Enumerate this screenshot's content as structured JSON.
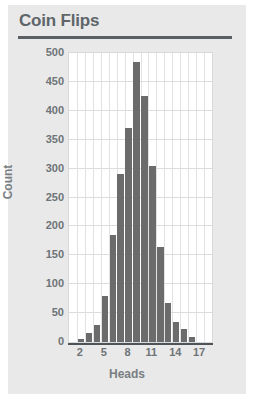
{
  "card": {
    "background_color": "#e9e9e9"
  },
  "header": {
    "title": "Coin Flips",
    "rule_color": "#5a5f63"
  },
  "chart_data": {
    "type": "bar",
    "title": "Coin Flips",
    "xlabel": "Heads",
    "ylabel": "Count",
    "categories": [
      1,
      2,
      3,
      4,
      5,
      6,
      7,
      8,
      9,
      10,
      11,
      12,
      13,
      14,
      15,
      16,
      17,
      18
    ],
    "values": [
      0,
      5,
      15,
      30,
      80,
      185,
      290,
      370,
      485,
      425,
      305,
      165,
      67,
      35,
      22,
      8,
      0,
      0
    ],
    "xlim": [
      0.5,
      18.5
    ],
    "ylim": [
      0,
      500
    ],
    "ytick_values": [
      0,
      50,
      100,
      150,
      200,
      250,
      300,
      350,
      400,
      450,
      500
    ],
    "ytick_labels": [
      "0",
      "50",
      "100",
      "150",
      "200",
      "250",
      "300",
      "350",
      "400",
      "450",
      "500"
    ],
    "xtick_values": [
      2,
      5,
      8,
      11,
      14,
      17
    ],
    "xtick_labels": [
      "2",
      "5",
      "8",
      "11",
      "14",
      "17"
    ],
    "grid": true,
    "legend": false,
    "bar_color": "#6b6b6b",
    "plot_background": "#ffffff",
    "gridline_color": "#dcdcdc",
    "axis_text_color": "#6e7478",
    "axis_label_color": "#787e82"
  }
}
